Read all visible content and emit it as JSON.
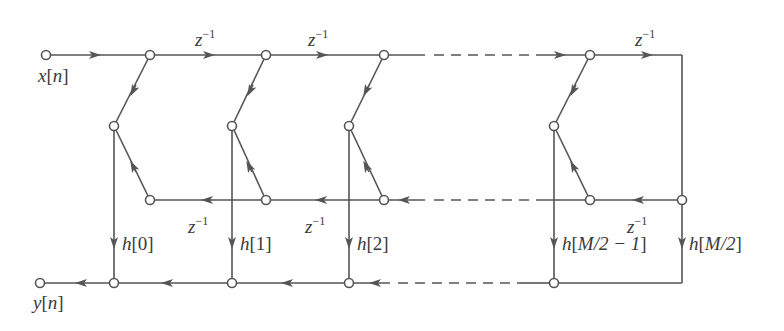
{
  "diagram": {
    "colors": {
      "line": "#555555",
      "node_fill": "#ffffff",
      "text": "#3a3a3a",
      "background": "#ffffff"
    },
    "input": {
      "var": "x",
      "idx": "n"
    },
    "output": {
      "var": "y",
      "idx": "n"
    },
    "delay": {
      "base": "z",
      "exp": "−1"
    },
    "top_delays": [
      {
        "x": 210,
        "y": 20
      },
      {
        "x": 323,
        "y": 20
      },
      {
        "x": 636,
        "y": 20
      }
    ],
    "mid_delays": [
      {
        "x": 188,
        "y": 214
      },
      {
        "x": 305,
        "y": 214
      },
      {
        "x": 627,
        "y": 214
      }
    ],
    "coefficients": [
      {
        "name": "h",
        "idx": "0",
        "x": 122,
        "y": 232
      },
      {
        "name": "h",
        "idx": "1",
        "x": 240,
        "y": 232
      },
      {
        "name": "h",
        "idx": "2",
        "x": 358,
        "y": 232
      },
      {
        "name": "h",
        "idx": "M/2 − 1",
        "x": 562,
        "y": 232
      },
      {
        "name": "h",
        "idx": "M/2",
        "x": 689,
        "y": 232
      }
    ]
  }
}
